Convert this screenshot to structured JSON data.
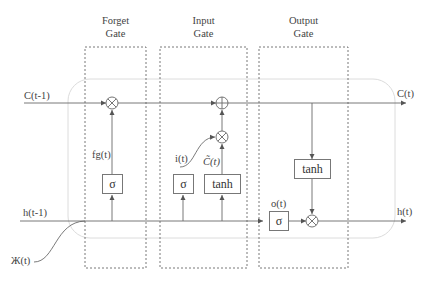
{
  "diagram": {
    "type": "LSTM cell",
    "gates": [
      {
        "id": "forget",
        "title_line1": "Forget",
        "title_line2": "Gate"
      },
      {
        "id": "input",
        "title_line1": "Input",
        "title_line2": "Gate"
      },
      {
        "id": "output",
        "title_line1": "Output",
        "title_line2": "Gate"
      }
    ],
    "inputs": {
      "cell_prev": "C(t-1)",
      "hidden_prev": "h(t-1)",
      "x": "Ж(t)"
    },
    "outputs": {
      "cell": "C(t)",
      "hidden": "h(t)"
    },
    "signals": {
      "forget": "fg(t)",
      "input": "i(t)",
      "candidate": "C̃(t)",
      "output": "o(t)"
    },
    "activations": {
      "sigma": "σ",
      "tanh": "tanh"
    },
    "operators": {
      "multiply": "⊗",
      "add": "⊕"
    },
    "colors": {
      "line": "#6a6a6a",
      "dashed_border": "#555555",
      "cell_outline": "#d8d8d8",
      "text": "#444444"
    }
  }
}
